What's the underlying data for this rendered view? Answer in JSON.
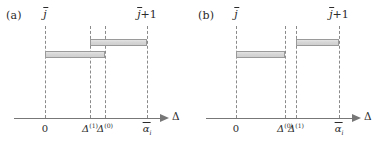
{
  "figure": {
    "background": "#ffffff",
    "bar_fill": "#d9d9d9",
    "bar_border": "#9a9a9a",
    "dash_color": "#8a8a8a",
    "axis_color": "#777777",
    "text_color": "#2b2b2b"
  },
  "panels": [
    {
      "id": "a",
      "letter": "(a)",
      "axis": {
        "label_symbol": "Δ",
        "label_name": "delta-axis-label"
      },
      "top_labels": [
        {
          "name": "j-bar-label",
          "base": "j",
          "overbar": true,
          "suffix": ""
        },
        {
          "name": "j-bar-plus-1-label",
          "base": "j",
          "overbar": true,
          "suffix": "+1"
        }
      ],
      "ticks": [
        {
          "name": "tick-zero",
          "base": "0",
          "overbar": false,
          "sup": "",
          "sub": ""
        },
        {
          "name": "tick-delta-sup-1",
          "base": "Δ",
          "overbar": false,
          "sup": "(1)",
          "sub": ""
        },
        {
          "name": "tick-delta-sup-0",
          "base": "Δ",
          "overbar": false,
          "sup": "(0)",
          "sub": ""
        },
        {
          "name": "tick-alpha-bar-i",
          "base": "α",
          "overbar": true,
          "sup": "",
          "sub": "i"
        }
      ],
      "bars": [
        {
          "name": "bar-lower-interval",
          "from_tick": 0,
          "to_tick": 2
        },
        {
          "name": "bar-upper-interval",
          "from_tick": 1,
          "to_tick": 3
        }
      ]
    },
    {
      "id": "b",
      "letter": "(b)",
      "axis": {
        "label_symbol": "Δ",
        "label_name": "delta-axis-label"
      },
      "top_labels": [
        {
          "name": "j-bar-label",
          "base": "j",
          "overbar": true,
          "suffix": ""
        },
        {
          "name": "j-bar-plus-1-label",
          "base": "j",
          "overbar": true,
          "suffix": "+1"
        }
      ],
      "ticks": [
        {
          "name": "tick-zero",
          "base": "0",
          "overbar": false,
          "sup": "",
          "sub": ""
        },
        {
          "name": "tick-delta-sup-0",
          "base": "Δ",
          "overbar": false,
          "sup": "(0)",
          "sub": ""
        },
        {
          "name": "tick-delta-sup-1",
          "base": "Δ",
          "overbar": false,
          "sup": "(1)",
          "sub": ""
        },
        {
          "name": "tick-alpha-bar-i",
          "base": "α",
          "overbar": true,
          "sup": "",
          "sub": "i"
        }
      ],
      "bars": [
        {
          "name": "bar-lower-interval",
          "from_tick": 0,
          "to_tick": 1
        },
        {
          "name": "bar-upper-interval",
          "from_tick": 2,
          "to_tick": 3
        }
      ]
    }
  ],
  "geometry": {
    "panel_width": 192,
    "panel_height": 144,
    "axis_y": 118,
    "bar_y_upper": 39,
    "bar_y_lower": 51,
    "a_tick_x": [
      45,
      90,
      105,
      147
    ],
    "b_tick_x": [
      44,
      93,
      104,
      147
    ],
    "a_top_label_x": [
      45,
      147
    ],
    "b_top_label_x": [
      44,
      147
    ],
    "axis_arrow_x": 160,
    "axis_label_x": 172
  }
}
